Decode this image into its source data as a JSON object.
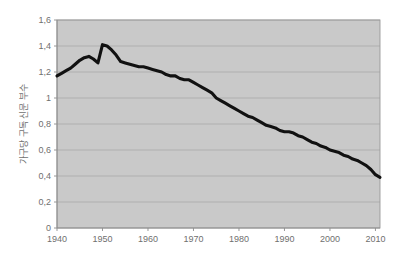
{
  "chart_data": {
    "type": "line",
    "title": "",
    "subtitle": "",
    "xlabel": "",
    "ylabel": "가구당 구독 신문 부수",
    "xlim": [
      1940,
      2011
    ],
    "ylim": [
      0,
      1.6
    ],
    "grid": true,
    "legend": false,
    "legend_position": "none",
    "decimal_separator": ",",
    "y_ticks": [
      0,
      0.2,
      0.4,
      0.6,
      0.8,
      1,
      1.2,
      1.4,
      1.6
    ],
    "y_tick_labels": [
      "0",
      "0,2",
      "0,4",
      "0,6",
      "0,8",
      "1",
      "1,2",
      "1,4",
      "1,6"
    ],
    "x_ticks": [
      1940,
      1950,
      1960,
      1970,
      1980,
      1990,
      2000,
      2010
    ],
    "x_tick_labels": [
      "1940",
      "1950",
      "1960",
      "1970",
      "1980",
      "1990",
      "2000",
      "2010"
    ],
    "series": [
      {
        "name": "가구당 구독 신문 부수",
        "color": "#111111",
        "line_width": 3.1,
        "x": [
          1940,
          1941,
          1942,
          1943,
          1944,
          1945,
          1946,
          1947,
          1948,
          1949,
          1950,
          1951,
          1952,
          1953,
          1954,
          1955,
          1956,
          1957,
          1958,
          1959,
          1960,
          1961,
          1962,
          1963,
          1964,
          1965,
          1966,
          1967,
          1968,
          1969,
          1970,
          1971,
          1972,
          1973,
          1974,
          1975,
          1976,
          1977,
          1978,
          1979,
          1980,
          1981,
          1982,
          1983,
          1984,
          1985,
          1986,
          1987,
          1988,
          1989,
          1990,
          1991,
          1992,
          1993,
          1994,
          1995,
          1996,
          1997,
          1998,
          1999,
          2000,
          2001,
          2002,
          2003,
          2004,
          2005,
          2006,
          2007,
          2008,
          2009,
          2010,
          2011
        ],
        "values": [
          1.17,
          1.19,
          1.21,
          1.23,
          1.26,
          1.29,
          1.31,
          1.32,
          1.3,
          1.27,
          1.41,
          1.4,
          1.37,
          1.33,
          1.28,
          1.27,
          1.26,
          1.25,
          1.24,
          1.24,
          1.23,
          1.22,
          1.21,
          1.2,
          1.18,
          1.17,
          1.17,
          1.15,
          1.14,
          1.14,
          1.12,
          1.1,
          1.08,
          1.06,
          1.04,
          1.0,
          0.98,
          0.96,
          0.94,
          0.92,
          0.9,
          0.88,
          0.86,
          0.85,
          0.83,
          0.81,
          0.79,
          0.78,
          0.77,
          0.75,
          0.74,
          0.74,
          0.73,
          0.71,
          0.7,
          0.68,
          0.66,
          0.65,
          0.63,
          0.62,
          0.6,
          0.59,
          0.58,
          0.56,
          0.55,
          0.53,
          0.52,
          0.5,
          0.48,
          0.45,
          0.41,
          0.39
        ]
      }
    ],
    "notes": {
      "start_value": "1.17",
      "peak_value": "1.41",
      "peak_year": "1950",
      "secondary_peak_value": "1.32",
      "secondary_peak_year": "1947",
      "end_value": "0.39",
      "end_year": "2011"
    },
    "colors": {
      "plot_background": "#c9c9c9",
      "page_background": "#ffffff",
      "gridline": "#a9a9a9",
      "axis": "#8c8c8c",
      "tick_text": "#6f6f6f",
      "line": "#111111"
    }
  }
}
